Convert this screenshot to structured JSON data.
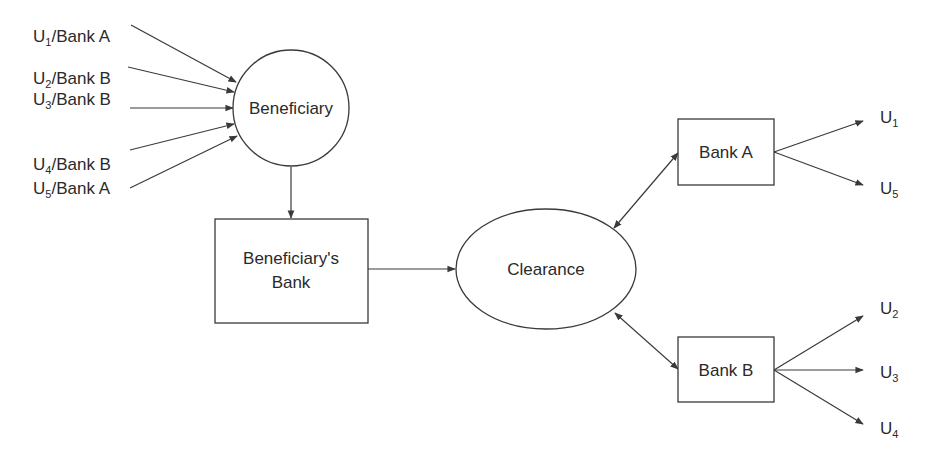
{
  "diagram": {
    "nodes": {
      "beneficiary": {
        "label": "Beneficiary"
      },
      "beneficiary_bank": {
        "label_line1": "Beneficiary's",
        "label_line2": "Bank"
      },
      "clearance": {
        "label": "Clearance"
      },
      "bank_a": {
        "label": "Bank A"
      },
      "bank_b": {
        "label": "Bank B"
      }
    },
    "inputs": [
      {
        "user": "U",
        "sub": "1",
        "bank": "/Bank A"
      },
      {
        "user": "U",
        "sub": "2",
        "bank": "/Bank B"
      },
      {
        "user": "U",
        "sub": "3",
        "bank": "/Bank B"
      },
      {
        "user": "U",
        "sub": "4",
        "bank": "/Bank B"
      },
      {
        "user": "U",
        "sub": "5",
        "bank": "/Bank A"
      }
    ],
    "bank_a_outputs": [
      {
        "user": "U",
        "sub": "1"
      },
      {
        "user": "U",
        "sub": "5"
      }
    ],
    "bank_b_outputs": [
      {
        "user": "U",
        "sub": "2"
      },
      {
        "user": "U",
        "sub": "3"
      },
      {
        "user": "U",
        "sub": "4"
      }
    ],
    "edges": [
      {
        "from": "U1/Bank A",
        "to": "Beneficiary",
        "type": "directed"
      },
      {
        "from": "U2/Bank B",
        "to": "Beneficiary",
        "type": "directed"
      },
      {
        "from": "U3/Bank B",
        "to": "Beneficiary",
        "type": "directed"
      },
      {
        "from": "U4/Bank B",
        "to": "Beneficiary",
        "type": "directed"
      },
      {
        "from": "U5/Bank A",
        "to": "Beneficiary",
        "type": "directed"
      },
      {
        "from": "Beneficiary",
        "to": "Beneficiary's Bank",
        "type": "directed"
      },
      {
        "from": "Beneficiary's Bank",
        "to": "Clearance",
        "type": "directed"
      },
      {
        "from": "Clearance",
        "to": "Bank A",
        "type": "bidirectional"
      },
      {
        "from": "Clearance",
        "to": "Bank B",
        "type": "bidirectional"
      },
      {
        "from": "Bank A",
        "to": "U1",
        "type": "directed"
      },
      {
        "from": "Bank A",
        "to": "U5",
        "type": "directed"
      },
      {
        "from": "Bank B",
        "to": "U2",
        "type": "directed"
      },
      {
        "from": "Bank B",
        "to": "U3",
        "type": "directed"
      },
      {
        "from": "Bank B",
        "to": "U4",
        "type": "directed"
      }
    ],
    "colors": {
      "stroke": "#3a3a3a",
      "text": "#2a2a2a",
      "background": "#ffffff"
    }
  }
}
